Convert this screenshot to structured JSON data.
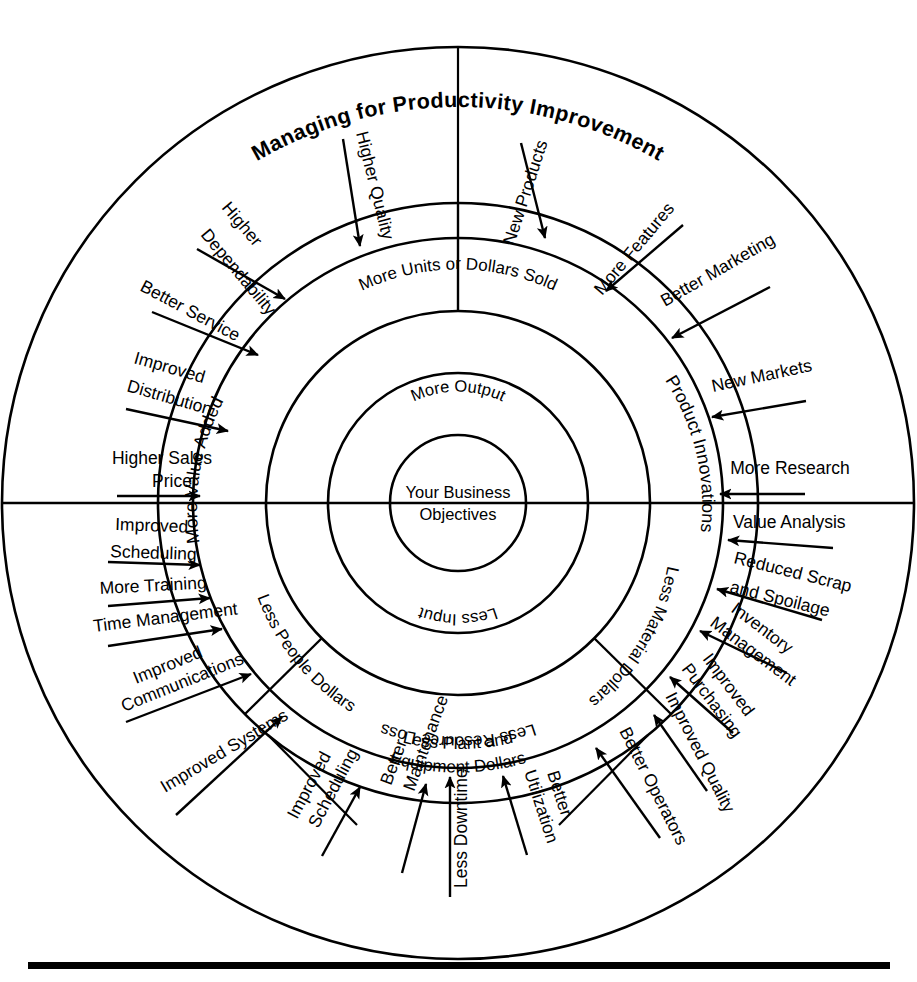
{
  "title": "Managing for Productivity Improvement",
  "geometry": {
    "cx": 458,
    "cy": 503,
    "r_outer": 456,
    "r_ring2": 300,
    "r_ring3": 265,
    "r_ring4": 192,
    "r_ring5": 130,
    "r_core": 68
  },
  "core": {
    "line1": "Your Business",
    "line2": "Objectives"
  },
  "ring_inner": {
    "top": "More Output",
    "bottom": "Less Input"
  },
  "ring_mid": {
    "top": "More Units or Dollars Sold",
    "bottom": "Less Resource Loss"
  },
  "quadrants": [
    {
      "name": "more-value-added",
      "label": "More Value Added"
    },
    {
      "name": "product-innovations",
      "label": "Product Innovations"
    },
    {
      "name": "less-material-dollars",
      "label": "Less Material Dollars"
    },
    {
      "name": "less-plant-and-equipment-dollars",
      "label": "Less Plant and\nEquipment Dollars",
      "line1": "Less Plant and",
      "line2": "Equipment Dollars"
    },
    {
      "name": "less-people-dollars",
      "label": "Less People Dollars"
    }
  ],
  "drivers": {
    "more_value_added": [
      "Higher Quality",
      "Higher Dependability",
      "Better Service",
      "Improved Distribution",
      "Higher Sales Price"
    ],
    "product_innovations": [
      "New Products",
      "More Features",
      "Better Marketing",
      "New Markets",
      "More Research"
    ],
    "less_material_dollars": [
      "Value Analysis",
      "Reduced Scrap and Spoilage",
      "Inventory Management",
      "Improved Purchasing",
      "Improved Quality",
      "Better Operators"
    ],
    "less_plant_and_equipment_dollars": [
      "Better Utilization",
      "Less Downtime",
      "Better Maintenance",
      "Improved Scheduling"
    ],
    "less_people_dollars": [
      "Improved Scheduling",
      "More Training",
      "Time Management",
      "Improved Communications",
      "Improved Systems"
    ]
  },
  "arrow_labels": {
    "higher_quality": "Higher Quality",
    "higher_dependability_l1": "Higher",
    "higher_dependability_l2": "Dependability",
    "better_service": "Better Service",
    "improved_distribution_l1": "Improved",
    "improved_distribution_l2": "Distribution",
    "higher_sales_price_l1": "Higher Sales",
    "higher_sales_price_l2": "Price",
    "new_products": "New Products",
    "more_features": "More Features",
    "better_marketing": "Better Marketing",
    "new_markets": "New Markets",
    "more_research": "More Research",
    "value_analysis": "Value Analysis",
    "reduced_scrap_l1": "Reduced Scrap",
    "reduced_scrap_l2": "and Spoilage",
    "inventory_l1": "Inventory",
    "inventory_l2": "Management",
    "improved_purchasing_l1": "Improved",
    "improved_purchasing_l2": "Purchasing",
    "improved_quality": "Improved Quality",
    "better_operators": "Better Operators",
    "better_utilization_l1": "Better",
    "better_utilization_l2": "Utilization",
    "less_downtime": "Less Downtime",
    "better_maintenance_l1": "Better",
    "better_maintenance_l2": "Maintenance",
    "improved_scheduling_bottom_l1": "Improved",
    "improved_scheduling_bottom_l2": "Scheduling",
    "improved_scheduling_left_l1": "Improved",
    "improved_scheduling_left_l2": "Scheduling",
    "more_training": "More Training",
    "time_management": "Time Management",
    "improved_communications_l1": "Improved",
    "improved_communications_l2": "Communications",
    "improved_systems": "Improved Systems"
  },
  "colors": {
    "stroke": "#000000",
    "background": "#ffffff"
  }
}
